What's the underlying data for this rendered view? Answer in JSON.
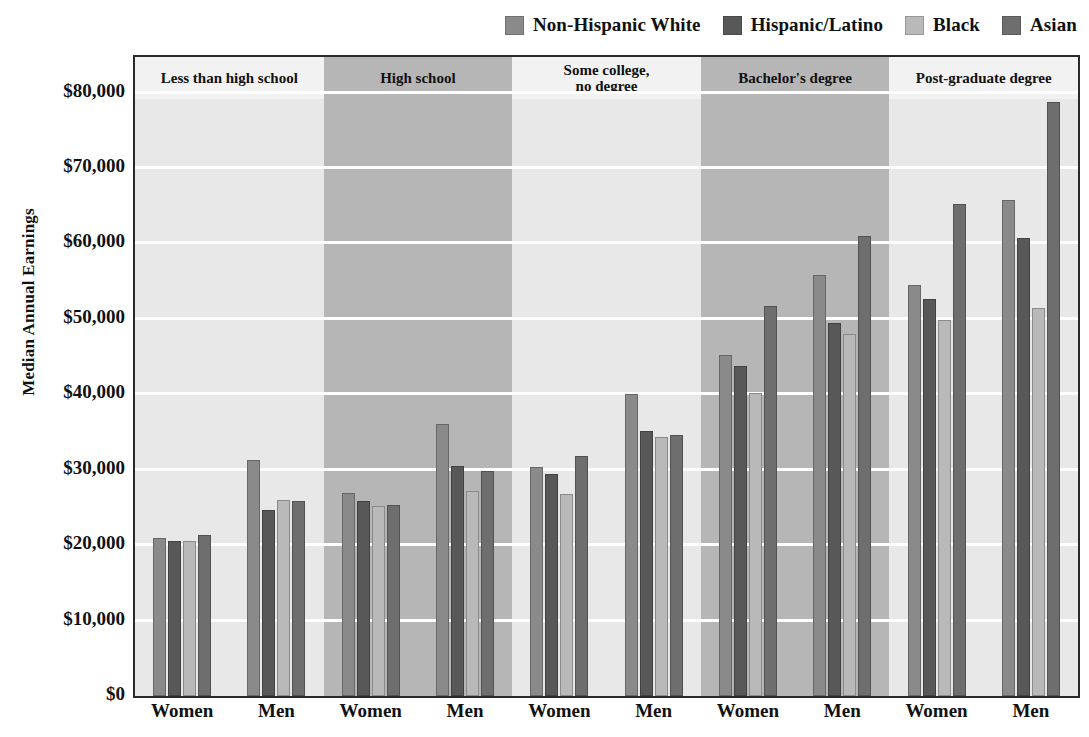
{
  "chart_data": {
    "type": "bar",
    "title": "",
    "xlabel": "",
    "ylabel": "Median Annual Earnings",
    "ylim": [
      0,
      83000
    ],
    "grid": true,
    "legend_position": "top-right",
    "ytick_labels": [
      "$0",
      "$10,000",
      "$20,000",
      "$30,000",
      "$40,000",
      "$50,000",
      "$60,000",
      "$70,000",
      "$80,000"
    ],
    "ytick_values": [
      0,
      10000,
      20000,
      30000,
      40000,
      50000,
      60000,
      70000,
      80000
    ],
    "panels": [
      "Less than high school",
      "High school",
      "Some college,\nno degree",
      "Bachelor's degree",
      "Post-graduate degree"
    ],
    "panel_labels": [
      [
        "Less than high school"
      ],
      [
        "High school"
      ],
      [
        "Some college,",
        "no degree"
      ],
      [
        "Bachelor's degree"
      ],
      [
        "Post-graduate degree"
      ]
    ],
    "groups": [
      "Women",
      "Men",
      "Women",
      "Men",
      "Women",
      "Men",
      "Women",
      "Men",
      "Women",
      "Men"
    ],
    "categories": [
      "Less than high school - Women",
      "Less than high school - Men",
      "High school - Women",
      "High school - Men",
      "Some college, no degree - Women",
      "Some college, no degree - Men",
      "Bachelor's degree - Women",
      "Bachelor's degree - Men",
      "Post-graduate degree - Women",
      "Post-graduate degree - Men"
    ],
    "series": [
      {
        "name": "Non-Hispanic White",
        "color": "#8a8a8a",
        "values": [
          21000,
          31300,
          26900,
          36100,
          30400,
          40000,
          45200,
          55800,
          54500,
          65700
        ]
      },
      {
        "name": "Hispanic/Latino",
        "color": "#585858",
        "values": [
          20500,
          24700,
          25800,
          30500,
          29400,
          35200,
          43800,
          49500,
          52700,
          60700
        ]
      },
      {
        "name": "Black",
        "color": "#b9b9b9",
        "values": [
          20500,
          26000,
          25200,
          27200,
          26800,
          34300,
          40200,
          48000,
          49800,
          51400
        ]
      },
      {
        "name": "Asian",
        "color": "#6e6e6e",
        "values": [
          21300,
          25900,
          25300,
          29800,
          31800,
          34600,
          51700,
          61000,
          65200,
          78800
        ]
      }
    ]
  },
  "style": {
    "plot_background": "#ebebeb",
    "band_light": "#e8e8e8",
    "band_dark": "#b6b6b6",
    "gridline_color": "#ffffff",
    "frame_color": "#2a2a2a",
    "text_color": "#111111"
  }
}
